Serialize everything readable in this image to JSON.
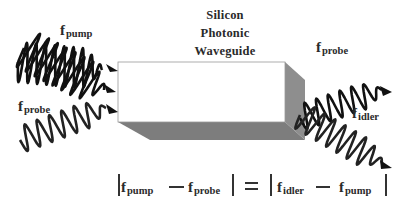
{
  "title": {
    "lines": [
      "Silicon",
      "Photonic",
      "Waveguide"
    ]
  },
  "waves": {
    "pump_in": {
      "symbol": "f",
      "subscript": "pump"
    },
    "probe_in": {
      "symbol": "f",
      "subscript": "probe"
    },
    "probe_out": {
      "symbol": "f",
      "subscript": "probe"
    },
    "idler_out": {
      "symbol": "f",
      "subscript": "idler"
    }
  },
  "equation": {
    "lhs": [
      {
        "symbol": "f",
        "subscript": "pump"
      },
      {
        "symbol": "f",
        "subscript": "probe"
      }
    ],
    "equals": "=",
    "rhs": [
      {
        "symbol": "f",
        "subscript": "idler"
      },
      {
        "symbol": "f",
        "subscript": "pump"
      }
    ],
    "operator": "−"
  },
  "colors": {
    "wave": "#111111",
    "box_front": "#ffffff",
    "box_side": "#8c8c8c",
    "box_bottom": "#7a7a7a",
    "text": "#2a2a2a"
  }
}
